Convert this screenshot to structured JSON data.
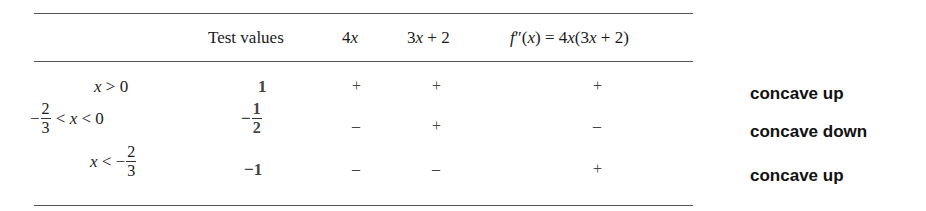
{
  "table": {
    "headers": {
      "test_values": "Test values",
      "col_4x": {
        "coef": "4",
        "var": "x"
      },
      "col_3x2": {
        "coef": "3",
        "var": "x",
        "rest": " + 2"
      },
      "col_fpp": {
        "fn": "f",
        "primes": "″",
        "arg_open": "(",
        "var": "x",
        "arg_close": ")",
        "eq": " = 4",
        "var2": "x",
        "tail_open": "(3",
        "var3": "x",
        "tail_close": " + 2)"
      }
    },
    "rows": [
      {
        "interval": {
          "var": "x",
          "rel": " > 0"
        },
        "test_value": "1",
        "sign_4x": "+",
        "sign_3x2": "+",
        "sign_fpp": "+",
        "conclusion": "concave up"
      },
      {
        "interval": {
          "neg": "−",
          "num": "2",
          "den": "3",
          "rel1": " < ",
          "var": "x",
          "rel2": " < 0"
        },
        "test_value": {
          "neg": "−",
          "num": "1",
          "den": "2"
        },
        "sign_4x": "–",
        "sign_3x2": "+",
        "sign_fpp": "–",
        "conclusion": "concave down"
      },
      {
        "interval": {
          "var": "x",
          "rel": " < −",
          "num": "2",
          "den": "3"
        },
        "test_value": "−1",
        "sign_4x": "–",
        "sign_3x2": "–",
        "sign_fpp": "+",
        "conclusion": "concave up"
      }
    ]
  }
}
